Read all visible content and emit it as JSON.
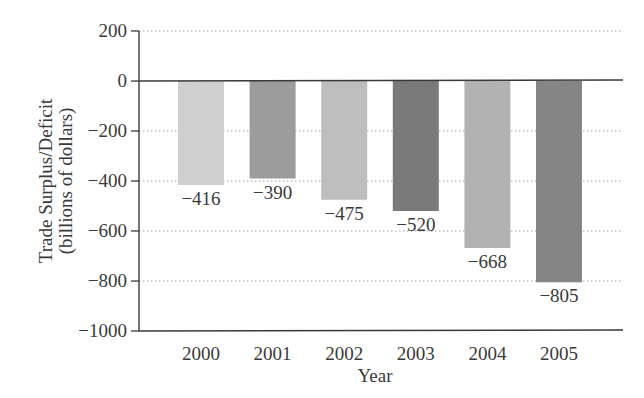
{
  "chart_data": {
    "type": "bar",
    "title": "",
    "xlabel": "Year",
    "ylabel": "Trade Surplus/Deficit",
    "ylabel_sub": "(billions of dollars)",
    "categories": [
      "2000",
      "2001",
      "2002",
      "2003",
      "2004",
      "2005"
    ],
    "values": [
      -416,
      -390,
      -475,
      -520,
      -668,
      -805
    ],
    "data_labels": [
      "−416",
      "−390",
      "−475",
      "−520",
      "−668",
      "−805"
    ],
    "ylim": [
      -1000,
      200
    ],
    "yticks": [
      200,
      0,
      -200,
      -400,
      -600,
      -800,
      -1000
    ],
    "ytick_labels": [
      "200",
      "0",
      "−200",
      "−400",
      "−600",
      "−800",
      "−1000"
    ],
    "grid": "dotted horizontal",
    "legend": null,
    "bar_colors": [
      "#cfcfcf",
      "#9c9c9c",
      "#bdbdbd",
      "#7a7a7a",
      "#b2b2b2",
      "#858585"
    ]
  },
  "colors": {
    "axis": "#3a3a3a",
    "grid": "#9a9a9a",
    "background": "#ffffff"
  }
}
